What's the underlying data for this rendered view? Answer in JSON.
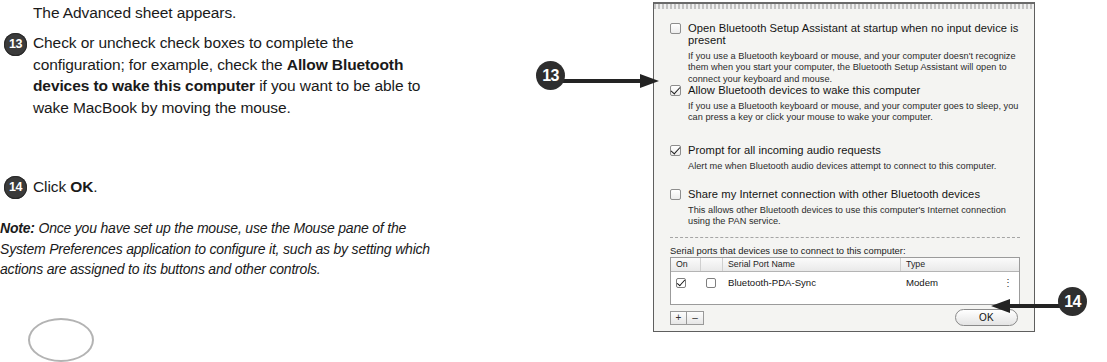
{
  "instructions": {
    "intro": "The Advanced sheet appears.",
    "step13": {
      "number": "13",
      "text_part1": "Check or uncheck check boxes to complete the configuration; for example, check the ",
      "bold_text": "Allow Bluetooth devices to wake this computer",
      "text_part2": " if you want to be able to wake MacBook by moving the mouse."
    },
    "step14": {
      "number": "14",
      "text_part1": "Click ",
      "bold_text": "OK",
      "text_part2": "."
    },
    "note": {
      "label": "Note:",
      "text": " Once you have set up the mouse, use the Mouse pane of the System Preferences application to configure it, such as by setting which actions are assigned to its buttons and other controls."
    }
  },
  "callouts": {
    "step13_marker": "13",
    "step14_marker": "14"
  },
  "dialog": {
    "options": [
      {
        "label": "Open Bluetooth Setup Assistant at startup when no input device is present",
        "checked": false,
        "description": "If you use a Bluetooth keyboard or mouse, and your computer doesn't recognize them when you start your computer, the Bluetooth Setup Assistant will open to connect your keyboard and mouse."
      },
      {
        "label": "Allow Bluetooth devices to wake this computer",
        "checked": true,
        "description": "If you use a Bluetooth keyboard or mouse, and your computer goes to sleep, you can press a key or click your mouse to wake your computer."
      },
      {
        "label": "Prompt for all incoming audio requests",
        "checked": true,
        "description": "Alert me when Bluetooth audio devices attempt to connect to this computer."
      },
      {
        "label": "Share my Internet connection with other Bluetooth devices",
        "checked": false,
        "description": "This allows other Bluetooth devices to use this computer's Internet connection using the PAN service."
      }
    ],
    "serial_caption": "Serial ports that devices use to connect to this computer:",
    "serial_table": {
      "headers": [
        "On",
        "",
        "Serial Port Name",
        "Type"
      ],
      "rows": [
        {
          "on": true,
          "flag": false,
          "name": "Bluetooth-PDA-Sync",
          "type": "Modem",
          "menu_icon": "vertical-ellipsis-icon"
        }
      ]
    },
    "add_button": "+",
    "remove_button": "–",
    "ok_button": "OK"
  }
}
